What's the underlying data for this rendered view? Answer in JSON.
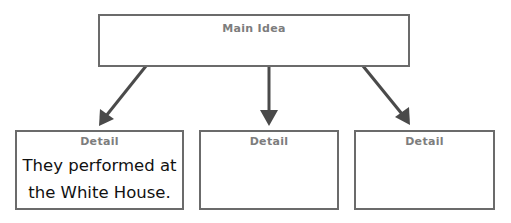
{
  "main_idea": {
    "label": "Main Idea",
    "text": ""
  },
  "details": [
    {
      "label": "Detail",
      "text_lines": [
        "They performed at",
        "the White House."
      ]
    },
    {
      "label": "Detail",
      "text_lines": []
    },
    {
      "label": "Detail",
      "text_lines": []
    }
  ],
  "colors": {
    "border": "#6b6b6b",
    "arrow": "#4a4a4a",
    "label": "#7d7d7d",
    "text": "#111111"
  }
}
